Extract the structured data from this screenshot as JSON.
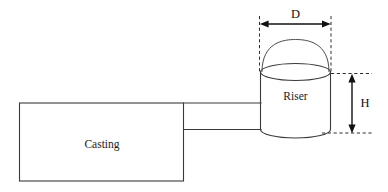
{
  "diagram": {
    "parts": {
      "casting_label": "Casting",
      "riser_label": "Riser"
    },
    "dimensions": {
      "diameter_label": "D",
      "height_label": "H"
    },
    "icons": {
      "arrow_left": "arrow-left-icon",
      "arrow_right": "arrow-right-icon",
      "arrow_up": "arrow-up-icon",
      "arrow_down": "arrow-down-icon"
    },
    "colors": {
      "stroke": "#3a3a3a",
      "dimension": "#111111",
      "background": "#ffffff"
    }
  }
}
